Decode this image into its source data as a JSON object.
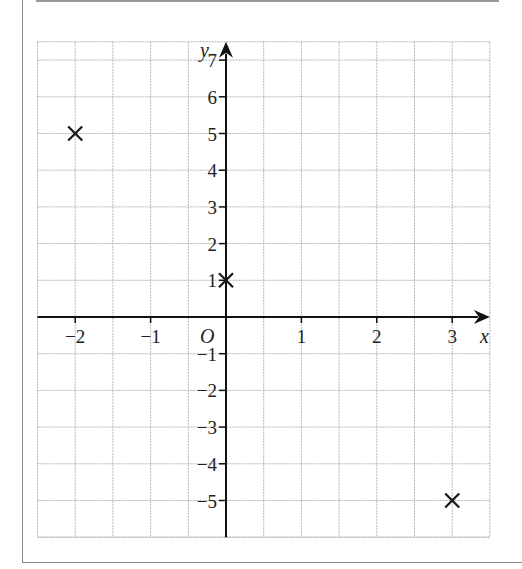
{
  "chart_data": {
    "type": "scatter",
    "title": "",
    "xlabel": "x",
    "ylabel": "y",
    "origin_label": "O",
    "xlim": [
      -2.5,
      3.5
    ],
    "ylim": [
      -6,
      7.5
    ],
    "x_ticks": [
      -2,
      -1,
      1,
      2,
      3
    ],
    "x_tick_labels": [
      "−2",
      "−1",
      "1",
      "2",
      "3"
    ],
    "y_ticks": [
      7,
      6,
      5,
      4,
      3,
      2,
      1,
      -1,
      -2,
      -3,
      -4,
      -5
    ],
    "y_tick_labels": [
      "7",
      "6",
      "5",
      "4",
      "3",
      "2",
      "1",
      "−1",
      "−2",
      "−3",
      "−4",
      "−5"
    ],
    "grid": true,
    "grid_x_step": 0.5,
    "grid_y_step": 1,
    "marker": "x",
    "points": [
      {
        "x": -2,
        "y": 5
      },
      {
        "x": 0,
        "y": 1
      },
      {
        "x": 3,
        "y": -5
      }
    ]
  },
  "colors": {
    "grid": "#b5b5b5",
    "axis": "#111111",
    "marker": "#1a1a1a",
    "frame": "#8c8c8c"
  }
}
